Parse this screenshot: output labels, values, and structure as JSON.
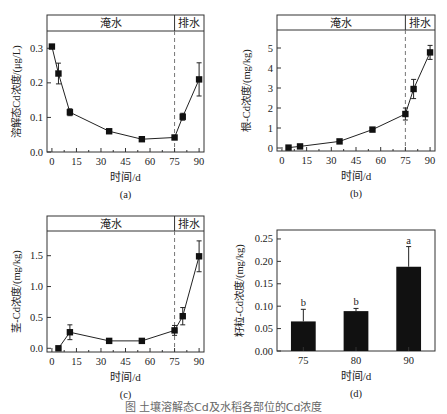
{
  "figure_caption": "图 土壤溶解态Cd及水稻各部位的Cd浓度",
  "chart_data": [
    {
      "panel": "(a)",
      "type": "line",
      "title": "",
      "xlabel": "时间/d",
      "ylabel": "溶解态Cd浓度/(μg/L)",
      "x_ticks": [
        "0",
        "15",
        "30",
        "45",
        "60",
        "75",
        "90"
      ],
      "y_ticks": [
        "0.0",
        "0.1",
        "0.2",
        "0.3"
      ],
      "xlim": [
        -3,
        93
      ],
      "ylim": [
        0,
        0.35
      ],
      "phase_labels": {
        "flood": "淹水",
        "drain": "排水"
      },
      "phase_boundary": 75,
      "x": [
        0,
        4,
        11,
        35,
        55,
        75,
        80,
        90
      ],
      "values": [
        0.305,
        0.227,
        0.115,
        0.06,
        0.037,
        0.042,
        0.102,
        0.21
      ],
      "errors": [
        0.005,
        0.03,
        0.01,
        0.004,
        0.004,
        0.004,
        0.01,
        0.048
      ],
      "grid": false
    },
    {
      "panel": "(b)",
      "type": "line",
      "title": "",
      "xlabel": "时间/d",
      "ylabel": "根-Cd浓度/(mg/kg)",
      "x_ticks": [
        "0",
        "15",
        "30",
        "45",
        "60",
        "75",
        "90"
      ],
      "y_ticks": [
        "0",
        "1",
        "2",
        "3",
        "4",
        "5"
      ],
      "xlim": [
        -3,
        93
      ],
      "ylim": [
        -0.15,
        5.9
      ],
      "phase_labels": {
        "flood": "淹水",
        "drain": "排水"
      },
      "phase_boundary": 75,
      "x": [
        4,
        11,
        35,
        55,
        75,
        80,
        90
      ],
      "values": [
        0.02,
        0.08,
        0.33,
        0.92,
        1.7,
        2.95,
        4.78
      ],
      "errors": [
        0.05,
        0.05,
        0.05,
        0.05,
        0.3,
        0.48,
        0.35
      ],
      "grid": false
    },
    {
      "panel": "(c)",
      "type": "line",
      "title": "",
      "xlabel": "时间/d",
      "ylabel": "茎-Cd浓度/(mg/kg)",
      "x_ticks": [
        "0",
        "15",
        "30",
        "45",
        "60",
        "75",
        "90"
      ],
      "y_ticks": [
        "0.0",
        "0.5",
        "1.0",
        "1.5"
      ],
      "xlim": [
        -3,
        93
      ],
      "ylim": [
        -0.06,
        1.9
      ],
      "phase_labels": {
        "flood": "淹水",
        "drain": "排水"
      },
      "phase_boundary": 75,
      "x": [
        4,
        11,
        35,
        55,
        75,
        80,
        90
      ],
      "values": [
        0.0,
        0.26,
        0.12,
        0.12,
        0.29,
        0.52,
        1.49
      ],
      "errors": [
        0.02,
        0.12,
        0.02,
        0.02,
        0.08,
        0.14,
        0.25
      ],
      "grid": false
    },
    {
      "panel": "(d)",
      "type": "bar",
      "title": "",
      "xlabel": "时间/d",
      "ylabel": "籽粒-Cd浓度/(mg/kg)",
      "categories": [
        "75",
        "80",
        "90"
      ],
      "values": [
        0.066,
        0.089,
        0.188
      ],
      "errors": [
        0.027,
        0.006,
        0.045
      ],
      "letters": [
        "b",
        "b",
        "a"
      ],
      "y_ticks": [
        "0.00",
        "0.05",
        "0.10",
        "0.15",
        "0.20",
        "0.25"
      ],
      "ylim": [
        0,
        0.27
      ],
      "bar_color": "#111111",
      "grid": false
    }
  ]
}
